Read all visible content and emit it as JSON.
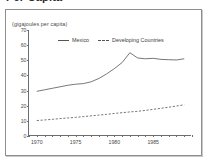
{
  "figure": {
    "title_clipped": "Per Capita",
    "unit_caption": "(gigajoules per capita)"
  },
  "legend": {
    "position": "top-center",
    "items": [
      {
        "label": "Mexico",
        "style": "solid"
      },
      {
        "label": "Developing Countries",
        "style": "dashed"
      }
    ]
  },
  "chart_data": {
    "type": "line",
    "title": "Per Capita",
    "subtitle": "",
    "xlabel": "",
    "ylabel": "(gigajoules per capita)",
    "xlim": [
      1969,
      1990
    ],
    "ylim": [
      0,
      70
    ],
    "ytick_labels": [
      "0",
      "10",
      "20",
      "30",
      "40",
      "50",
      "60",
      "70"
    ],
    "ytick_values": [
      0,
      10,
      20,
      30,
      40,
      50,
      60,
      70
    ],
    "xtick_labels": [
      "1970",
      "1975",
      "1980",
      "1985"
    ],
    "xtick_values": [
      1970,
      1975,
      1980,
      1985
    ],
    "x_minor_tick_interval": 1,
    "grid": false,
    "legend_position": "top-center",
    "x": [
      1970,
      1971,
      1972,
      1973,
      1974,
      1975,
      1976,
      1977,
      1978,
      1979,
      1980,
      1981,
      1982,
      1983,
      1984,
      1985,
      1986,
      1987,
      1988,
      1989
    ],
    "series": [
      {
        "name": "Mexico",
        "style": "solid",
        "color": "#555555",
        "values": [
          29.5,
          30.5,
          31.5,
          32.5,
          33.5,
          34.2,
          34.6,
          35.8,
          38.0,
          41.0,
          44.5,
          48.5,
          55.0,
          51.5,
          51.0,
          51.3,
          50.6,
          50.4,
          50.2,
          51.0
        ]
      },
      {
        "name": "Developing Countries",
        "style": "dashed",
        "color": "#555555",
        "values": [
          10.2,
          10.6,
          11.0,
          11.5,
          11.9,
          12.3,
          12.8,
          13.3,
          13.8,
          14.3,
          14.9,
          15.4,
          15.9,
          16.3,
          16.9,
          17.6,
          18.3,
          19.0,
          19.8,
          20.6
        ]
      }
    ]
  }
}
